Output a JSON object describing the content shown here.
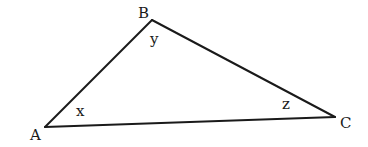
{
  "figure": {
    "type": "triangle",
    "vertices": {
      "A": {
        "label": "A",
        "x": 45,
        "y": 127
      },
      "B": {
        "label": "B",
        "x": 152,
        "y": 20
      },
      "C": {
        "label": "C",
        "x": 335,
        "y": 117
      }
    },
    "vertex_labels": {
      "A": "A",
      "B": "B",
      "C": "C"
    },
    "angle_labels": {
      "A": "x",
      "B": "y",
      "C": "z"
    },
    "edges": [
      {
        "from": "A",
        "to": "B"
      },
      {
        "from": "B",
        "to": "C"
      },
      {
        "from": "C",
        "to": "A"
      }
    ],
    "colors": {
      "stroke": "#1a1a1a",
      "background": "#ffffff"
    }
  }
}
